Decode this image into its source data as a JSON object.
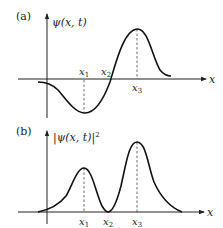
{
  "panels": [
    {
      "tag": "(a)",
      "ylabel": "ψ(x, t)",
      "xlabel": "x",
      "marks": [
        {
          "name": "x",
          "sub": "1"
        },
        {
          "name": "x",
          "sub": "2"
        },
        {
          "name": "x",
          "sub": "3"
        }
      ],
      "description": "Real-valued wave function: negative dip with minimum at x1, zero crossing at x2, positive maximum at x3"
    },
    {
      "tag": "(b)",
      "ylabel": "|ψ(x, t)|",
      "ylabel_sup": "2",
      "xlabel": "x",
      "marks": [
        {
          "name": "x",
          "sub": "1"
        },
        {
          "name": "x",
          "sub": "2"
        },
        {
          "name": "x",
          "sub": "3"
        }
      ],
      "description": "Probability density: local peak at x1, zero at x2, larger peak at x3"
    }
  ],
  "colors": {
    "curve": "#111111",
    "axis": "#222222",
    "dashed": "#444444"
  }
}
